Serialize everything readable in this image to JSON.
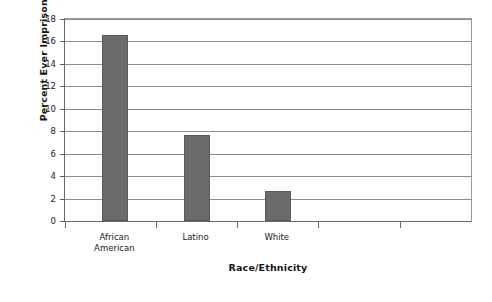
{
  "chart_data": {
    "type": "bar",
    "title": "",
    "xlabel": "Race/Ethnicity",
    "ylabel": "Percent Ever Imprisoned",
    "categories": [
      "African\nAmerican",
      "Latino",
      "White"
    ],
    "values": [
      16.6,
      7.7,
      2.7
    ],
    "ylim": [
      0,
      18
    ],
    "ytick_labels": [
      "0",
      "2",
      "4",
      "6",
      "8",
      "10",
      "12",
      "14",
      "16",
      "18"
    ],
    "ytick_values": [
      0,
      2,
      4,
      6,
      8,
      10,
      12,
      14,
      16,
      18
    ],
    "grid": "horizontal",
    "legend": "none",
    "bar_color": "#6b6b6b",
    "axis_color": "#6a6a6a",
    "grid_color": "#8d8d8d",
    "background": "#ffffff"
  }
}
